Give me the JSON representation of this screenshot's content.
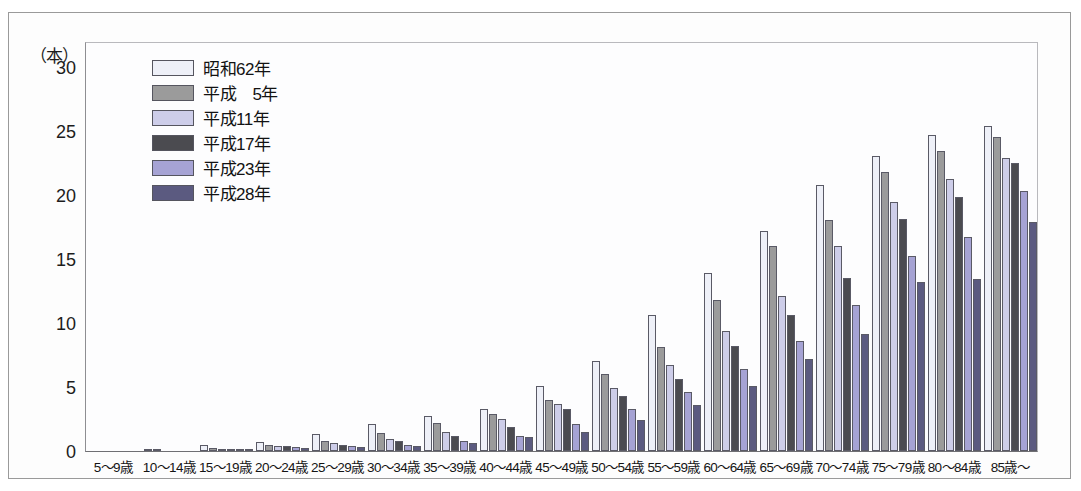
{
  "axis": {
    "unit_label": "（本）",
    "y_ticks": [
      0,
      5,
      10,
      15,
      20,
      25,
      30
    ]
  },
  "legend": {
    "items": [
      {
        "label": "昭和62年",
        "color": "#eef0f8"
      },
      {
        "label": "平成　5年",
        "color": "#9b9b9b"
      },
      {
        "label": "平成11年",
        "color": "#cdcde9"
      },
      {
        "label": "平成17年",
        "color": "#4b4b50"
      },
      {
        "label": "平成23年",
        "color": "#a6a3d4"
      },
      {
        "label": "平成28年",
        "color": "#5b5a80"
      }
    ]
  },
  "chart_data": {
    "type": "bar",
    "title": "",
    "subtitle": "",
    "xlabel": "",
    "ylabel": "（本）",
    "ylim": [
      0,
      32
    ],
    "grid": false,
    "legend_position": "inside-top-left",
    "categories": [
      "5〜9歳",
      "10〜14歳",
      "15〜19歳",
      "20〜24歳",
      "25〜29歳",
      "30〜34歳",
      "35〜39歳",
      "40〜44歳",
      "45〜49歳",
      "50〜54歳",
      "55〜59歳",
      "60〜64歳",
      "65〜69歳",
      "70〜74歳",
      "75〜79歳",
      "80〜84歳",
      "85歳〜"
    ],
    "series": [
      {
        "name": "昭和62年",
        "color": "#eef0f8",
        "values": [
          0.0,
          0.1,
          0.5,
          0.7,
          1.3,
          2.1,
          2.7,
          3.3,
          5.1,
          7.0,
          10.6,
          13.9,
          17.2,
          20.8,
          23.0,
          24.7,
          25.4
        ]
      },
      {
        "name": "平成　5年",
        "color": "#9b9b9b",
        "values": [
          0.0,
          0.1,
          0.2,
          0.5,
          0.8,
          1.4,
          2.2,
          2.9,
          4.0,
          6.0,
          8.1,
          11.8,
          16.0,
          18.0,
          21.8,
          23.4,
          24.5
        ]
      },
      {
        "name": "平成11年",
        "color": "#cdcde9",
        "values": [
          0.0,
          0.0,
          0.1,
          0.4,
          0.6,
          0.9,
          1.5,
          2.5,
          3.7,
          4.9,
          6.7,
          9.4,
          12.1,
          16.0,
          19.4,
          21.2,
          22.9
        ]
      },
      {
        "name": "平成17年",
        "color": "#4b4b50",
        "values": [
          0.0,
          0.0,
          0.1,
          0.4,
          0.5,
          0.8,
          1.2,
          1.9,
          3.3,
          4.3,
          5.6,
          8.2,
          10.6,
          13.5,
          18.1,
          19.8,
          22.5
        ]
      },
      {
        "name": "平成23年",
        "color": "#a6a3d4",
        "values": [
          0.0,
          0.0,
          0.1,
          0.3,
          0.4,
          0.5,
          0.8,
          1.2,
          2.1,
          3.3,
          4.6,
          6.4,
          8.6,
          11.4,
          15.2,
          16.7,
          20.3
        ]
      },
      {
        "name": "平成28年",
        "color": "#5b5a80",
        "values": [
          0.0,
          0.0,
          0.1,
          0.2,
          0.3,
          0.4,
          0.6,
          1.1,
          1.5,
          2.4,
          3.6,
          5.1,
          7.2,
          9.1,
          13.2,
          13.4,
          17.9
        ]
      }
    ]
  }
}
